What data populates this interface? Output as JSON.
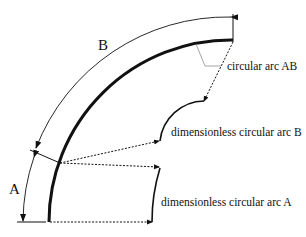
{
  "diagram": {
    "labels": {
      "segment_a": "A",
      "segment_b": "B",
      "arc_ab": "circular arc AB",
      "dimless_arc_b": "dimensionless circular arc B",
      "dimless_arc_a": "dimensionless circular arc A"
    },
    "colors": {
      "stroke": "#111111",
      "leader": "#9a9a9a",
      "background": "#ffffff"
    }
  }
}
